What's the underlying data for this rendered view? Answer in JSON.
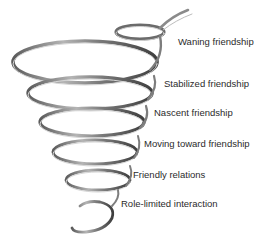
{
  "diagram": {
    "type": "spiral",
    "ribbon_color": "#8a8a8a",
    "ribbon_highlight": "#d9d9d9",
    "ribbon_shadow": "#4a4a4a",
    "labels": [
      {
        "text": "Waning friendship",
        "x": 178,
        "y": 36
      },
      {
        "text": "Stabilized friendship",
        "x": 164,
        "y": 78
      },
      {
        "text": "Nascent friendship",
        "x": 154,
        "y": 107
      },
      {
        "text": "Moving toward friendship",
        "x": 144,
        "y": 138
      },
      {
        "text": "Friendly relations",
        "x": 133,
        "y": 169
      },
      {
        "text": "Role-limited interaction",
        "x": 121,
        "y": 198
      }
    ]
  }
}
